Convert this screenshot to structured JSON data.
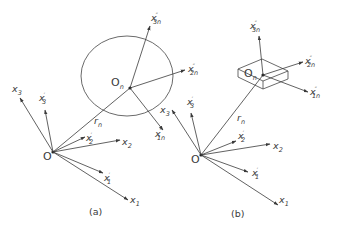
{
  "figure": {
    "panels": [
      {
        "id": "a",
        "caption": "(a)",
        "body_shape": "ellipse",
        "origin_label": "O",
        "body_origin_label": "O",
        "body_origin_subscript": "n",
        "position_vector": {
          "label": "r",
          "subscript": "n"
        },
        "fixed_axes": [
          {
            "name": "x",
            "sub": "1",
            "prime": ""
          },
          {
            "name": "x",
            "sub": "2",
            "prime": ""
          },
          {
            "name": "x",
            "sub": "3",
            "prime": ""
          }
        ],
        "intermediate_axes": [
          {
            "name": "x",
            "sub": "1",
            "prime": "′"
          },
          {
            "name": "x",
            "sub": "2",
            "prime": "′"
          },
          {
            "name": "x",
            "sub": "3",
            "prime": "′"
          }
        ],
        "body_axes": [
          {
            "name": "x",
            "sub": "1n",
            "prime": "″"
          },
          {
            "name": "x",
            "sub": "2n",
            "prime": "″"
          },
          {
            "name": "x",
            "sub": "3n",
            "prime": "″"
          }
        ]
      },
      {
        "id": "b",
        "caption": "(b)",
        "body_shape": "box",
        "origin_label": "O",
        "body_origin_label": "O",
        "body_origin_subscript": "n",
        "position_vector": {
          "label": "r",
          "subscript": "n"
        },
        "fixed_axes": [
          {
            "name": "x",
            "sub": "1",
            "prime": ""
          },
          {
            "name": "x",
            "sub": "2",
            "prime": ""
          },
          {
            "name": "x",
            "sub": "3",
            "prime": ""
          }
        ],
        "intermediate_axes": [
          {
            "name": "x",
            "sub": "1",
            "prime": "′"
          },
          {
            "name": "x",
            "sub": "2",
            "prime": "′"
          },
          {
            "name": "x",
            "sub": "3",
            "prime": "′"
          }
        ],
        "body_axes": [
          {
            "name": "x",
            "sub": "1n",
            "prime": "″"
          },
          {
            "name": "x",
            "sub": "2n",
            "prime": "″"
          },
          {
            "name": "x",
            "sub": "3n",
            "prime": "″"
          }
        ]
      }
    ],
    "colors": {
      "line": "#3a3a3a",
      "background": "#ffffff"
    }
  }
}
